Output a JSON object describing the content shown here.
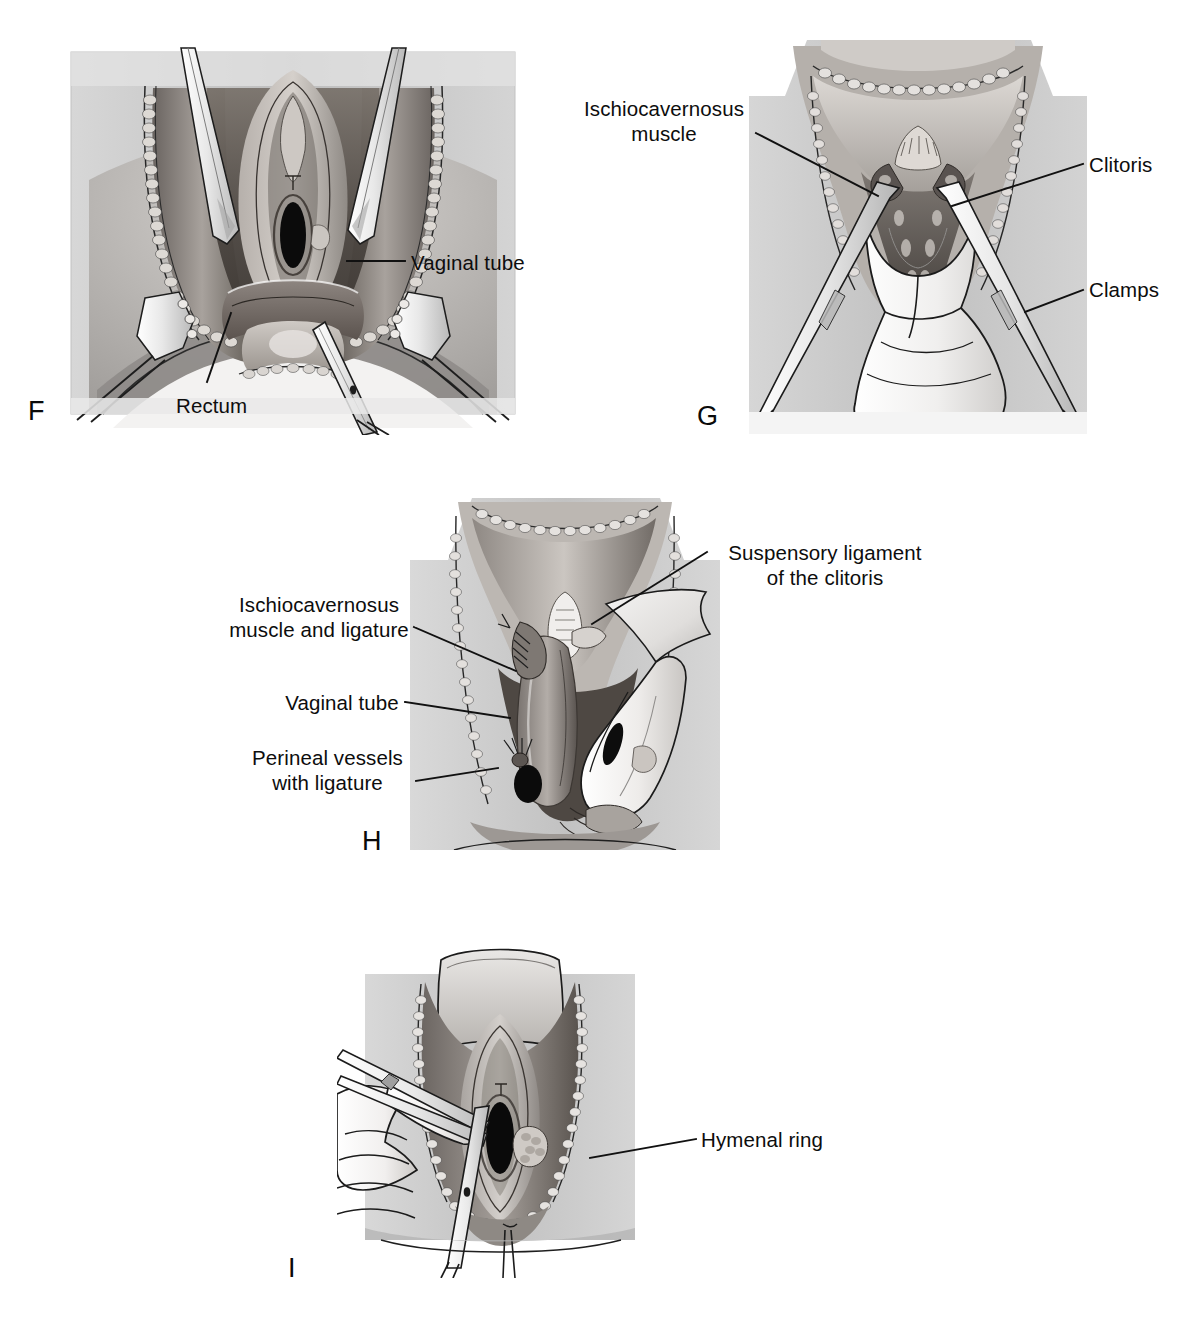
{
  "figure": {
    "background_color": "#ffffff",
    "ink_color": "#111111",
    "panel_count": 4
  },
  "panels": [
    {
      "id": "F",
      "letter": "F",
      "caption_letter_position": {
        "x": 28,
        "y": 398
      },
      "frame": {
        "x": 57,
        "y": 30,
        "w": 473,
        "h": 405
      },
      "labels": [
        {
          "name": "vaginal-tube",
          "text": "Vaginal tube",
          "align": "right",
          "x": 411,
          "y": 250,
          "leader": [
            [
              347,
              261
            ],
            [
              405,
              261
            ]
          ]
        },
        {
          "name": "rectum",
          "text": "Rectum",
          "align": "right",
          "x": 176,
          "y": 393,
          "leader": [
            [
              231,
              313
            ],
            [
              207,
              382
            ]
          ]
        }
      ]
    },
    {
      "id": "G",
      "letter": "G",
      "caption_letter_position": {
        "x": 697,
        "y": 403
      },
      "frame": {
        "x": 749,
        "y": 22,
        "w": 338,
        "h": 412
      },
      "labels": [
        {
          "name": "ischiocavernosus-muscle",
          "text": "Ischiocavernosus\nmuscle",
          "align": "left",
          "x": 580,
          "y": 96,
          "leader": [
            [
              756,
              133
            ],
            [
              870,
              193
            ]
          ]
        },
        {
          "name": "clitoris",
          "text": "Clitoris",
          "align": "right",
          "x": 1089,
          "y": 152,
          "leader": [
            [
              950,
              205
            ],
            [
              1083,
              164
            ]
          ]
        },
        {
          "name": "clamps",
          "text": "Clamps",
          "align": "right",
          "x": 1089,
          "y": 277,
          "leader": [
            [
              1025,
              312
            ],
            [
              1083,
              290
            ]
          ]
        }
      ]
    },
    {
      "id": "H",
      "letter": "H",
      "caption_letter_position": {
        "x": 362,
        "y": 828
      },
      "frame": {
        "x": 410,
        "y": 492,
        "w": 310,
        "h": 372
      },
      "labels": [
        {
          "name": "suspensory-ligament-of-clitoris",
          "text": "Suspensory ligament\nof the clitoris",
          "align": "right",
          "x": 713,
          "y": 540,
          "leader": [
            [
              592,
              624
            ],
            [
              707,
              552
            ]
          ]
        },
        {
          "name": "ischiocavernosus-muscle-and-ligature",
          "text": "Ischiocavernosus\nmuscle and ligature",
          "align": "left",
          "x": 226,
          "y": 592,
          "leader": [
            [
              414,
              627
            ],
            [
              512,
              669
            ]
          ]
        },
        {
          "name": "vaginal-tube",
          "text": "Vaginal tube",
          "align": "left",
          "x": 283,
          "y": 690,
          "leader": [
            [
              405,
              702
            ],
            [
              508,
              717
            ]
          ]
        },
        {
          "name": "perineal-vessels-with-ligature",
          "text": "Perineal vessels\nwith ligature",
          "align": "left",
          "x": 243,
          "y": 745,
          "leader": [
            [
              416,
              781
            ],
            [
              498,
              769
            ]
          ]
        }
      ]
    },
    {
      "id": "I",
      "letter": "I",
      "caption_letter_position": {
        "x": 288,
        "y": 1255
      },
      "frame": {
        "x": 337,
        "y": 938,
        "w": 325,
        "h": 340
      },
      "labels": [
        {
          "name": "hymenal-ring",
          "text": "Hymenal ring",
          "align": "right",
          "x": 701,
          "y": 1127,
          "leader": [
            [
              590,
              1158
            ],
            [
              696,
              1139
            ]
          ]
        }
      ]
    }
  ]
}
